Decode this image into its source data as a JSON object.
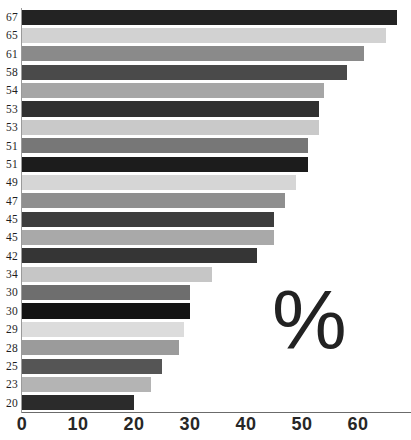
{
  "chart_data": {
    "type": "bar",
    "orientation": "horizontal",
    "title": "",
    "subtitle": "",
    "xlabel": "",
    "ylabel": "",
    "unit_annotation": "%",
    "xlim": [
      0,
      69
    ],
    "x_ticks": [
      0,
      10,
      20,
      30,
      40,
      50,
      60
    ],
    "x_tick_labels": [
      "0",
      "10",
      "20",
      "30",
      "40",
      "50",
      "60"
    ],
    "grid": false,
    "legend": "none",
    "categories": [
      "67",
      "65",
      "61",
      "58",
      "54",
      "53",
      "53",
      "51",
      "51",
      "49",
      "47",
      "45",
      "45",
      "42",
      "34",
      "30",
      "30",
      "29",
      "28",
      "25",
      "23",
      "20"
    ],
    "bars": [
      {
        "label": "67",
        "value": 67,
        "color": "#232323"
      },
      {
        "label": "65",
        "value": 65,
        "color": "#d2d2d2"
      },
      {
        "label": "61",
        "value": 61,
        "color": "#8a8a8a"
      },
      {
        "label": "58",
        "value": 58,
        "color": "#4a4a4a"
      },
      {
        "label": "54",
        "value": 54,
        "color": "#a6a6a6"
      },
      {
        "label": "53",
        "value": 53,
        "color": "#303030"
      },
      {
        "label": "53",
        "value": 53,
        "color": "#c9c9c9"
      },
      {
        "label": "51",
        "value": 51,
        "color": "#777777"
      },
      {
        "label": "51",
        "value": 51,
        "color": "#1c1c1c"
      },
      {
        "label": "49",
        "value": 49,
        "color": "#d6d6d6"
      },
      {
        "label": "47",
        "value": 47,
        "color": "#8f8f8f"
      },
      {
        "label": "45",
        "value": 45,
        "color": "#3d3d3d"
      },
      {
        "label": "45",
        "value": 45,
        "color": "#a9a9a9"
      },
      {
        "label": "42",
        "value": 42,
        "color": "#353535"
      },
      {
        "label": "34",
        "value": 34,
        "color": "#c6c6c6"
      },
      {
        "label": "30",
        "value": 30,
        "color": "#6e6e6e"
      },
      {
        "label": "30",
        "value": 30,
        "color": "#141414"
      },
      {
        "label": "29",
        "value": 29,
        "color": "#dcdcdc"
      },
      {
        "label": "28",
        "value": 28,
        "color": "#9b9b9b"
      },
      {
        "label": "25",
        "value": 25,
        "color": "#555555"
      },
      {
        "label": "23",
        "value": 23,
        "color": "#b4b4b4"
      },
      {
        "label": "20",
        "value": 20,
        "color": "#2b2b2b"
      }
    ]
  },
  "annotations": {
    "percent_glyph": "%"
  },
  "axis": {
    "tick_labels": [
      "0",
      "10",
      "20",
      "30",
      "40",
      "50",
      "60"
    ]
  },
  "colors": {
    "background": "#ffffff",
    "axis": "#6b6b6b",
    "tick_text": "#272727",
    "label_text": "#1e1e1e",
    "percent_text": "#222222"
  }
}
